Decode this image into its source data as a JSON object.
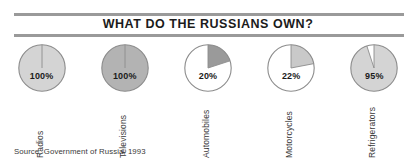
{
  "chart_data": {
    "type": "pie",
    "title": "WHAT DO THE RUSSIANS OWN?",
    "source": "Source: Government of Russia, 1993",
    "xlabel": "",
    "ylabel": "",
    "legend": "none",
    "grid": false,
    "note": "Five separate single-value pie charts, each showing the percentage of Russian households owning the item. Wedges start at 12 o'clock and sweep clockwise.",
    "categories": [
      "Radios",
      "Televisions",
      "Automobiles",
      "Motorcycles",
      "Refrigerators"
    ],
    "values": [
      100,
      100,
      20,
      22,
      95
    ],
    "value_labels": [
      "100%",
      "100%",
      "20%",
      "22%",
      "95%"
    ],
    "slices": [
      {
        "label": "Radios",
        "value": 100,
        "value_label": "100%",
        "fill": "#d4d4d4",
        "remainder_fill": "#ffffff",
        "stroke": "#8c8c8c"
      },
      {
        "label": "Televisions",
        "value": 100,
        "value_label": "100%",
        "fill": "#b3b3b3",
        "remainder_fill": "#ffffff",
        "stroke": "#8c8c8c"
      },
      {
        "label": "Automobiles",
        "value": 20,
        "value_label": "20%",
        "fill": "#9a9a9a",
        "remainder_fill": "#ffffff",
        "stroke": "#8c8c8c"
      },
      {
        "label": "Motorcycles",
        "value": 22,
        "value_label": "22%",
        "fill": "#c9c9c9",
        "remainder_fill": "#ffffff",
        "stroke": "#8c8c8c"
      },
      {
        "label": "Refrigerators",
        "value": 95,
        "value_label": "95%",
        "fill": "#d4d4d4",
        "remainder_fill": "#ffffff",
        "stroke": "#8c8c8c"
      }
    ]
  },
  "colors": {
    "rule": "#9a9a9a",
    "title_text": "#1b1b1b",
    "label_text": "#3a3a3a",
    "background": "#ffffff"
  }
}
